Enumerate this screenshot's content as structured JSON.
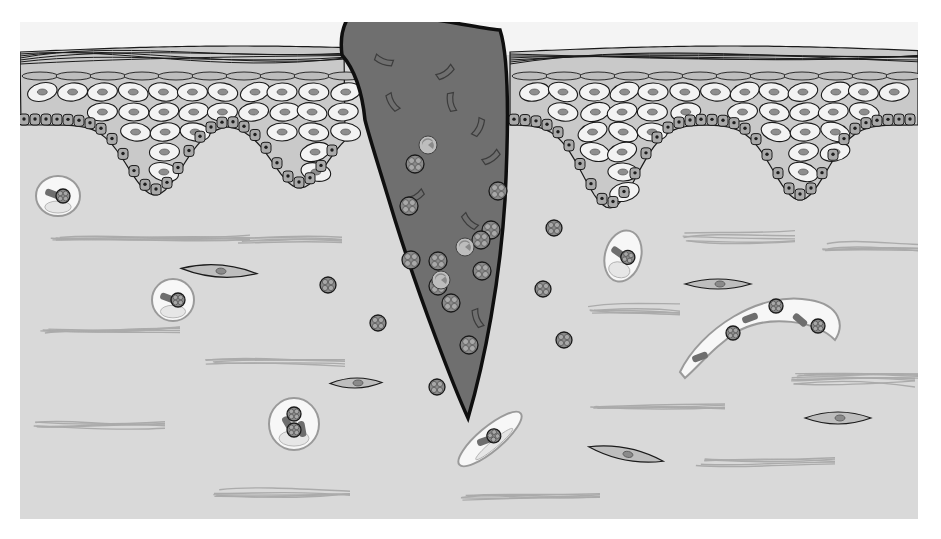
{
  "figure": {
    "width": 941,
    "height": 539,
    "panel": {
      "x": 20,
      "y": 22,
      "w": 898,
      "h": 497
    }
  },
  "colors": {
    "page_bg": "#ffffff",
    "top_bg": "#f4f4f4",
    "dermis": "#d9d9d9",
    "stratum_corneum": "#d6d6d6",
    "granular_layer": "#bdbdbd",
    "keratinocyte": "#f3f3f3",
    "keratinocyte_nucleus": "#8e8e8e",
    "intercellular": "#c9c9c9",
    "basal_cell": "#a9a9a9",
    "basal_nucleus": "#1e1e1e",
    "outline": "#1a1a1a",
    "wound": "#6f6f6f",
    "wound_outline": "#0f0f0f",
    "fibrin_fragment_stroke": "#3c3c3c",
    "neutrophil_fill": "#8a8a8a",
    "neutrophil_lobe": "#a8a8a8",
    "collagen": "#ababab",
    "fibroblast": "#bebebe",
    "fibroblast_nucleus": "#8a8a8a",
    "macrophage": "#f7f7f7",
    "macrophage_outline": "#9a9a9a",
    "macrophage_inclusion": "#6e6e6e"
  },
  "epidermis": {
    "left_segment": {
      "x0": 20,
      "x1": 345
    },
    "right_segment": {
      "x0": 510,
      "x1": 918
    },
    "rete_ridges": [
      {
        "cx": 155,
        "tip_y": 195
      },
      {
        "cx": 300,
        "tip_y": 188
      },
      {
        "cx": 610,
        "tip_y": 208
      },
      {
        "cx": 800,
        "tip_y": 200
      }
    ]
  },
  "wound": {
    "label": "ulcer-crater",
    "fibrin_fragments": [
      [
        384,
        60,
        20
      ],
      [
        445,
        72,
        -35
      ],
      [
        393,
        102,
        60
      ],
      [
        452,
        102,
        80
      ],
      [
        478,
        127,
        -65
      ],
      [
        491,
        157,
        -35
      ],
      [
        415,
        196,
        -30
      ],
      [
        470,
        221,
        45
      ],
      [
        478,
        318,
        70
      ]
    ],
    "neutrophils": [
      [
        415,
        164
      ],
      [
        498,
        191
      ],
      [
        409,
        206
      ],
      [
        491,
        230
      ],
      [
        411,
        260
      ],
      [
        481,
        240
      ],
      [
        438,
        261
      ],
      [
        482,
        271
      ],
      [
        451,
        303
      ],
      [
        469,
        345
      ],
      [
        438,
        286
      ]
    ],
    "degenerating_cells": [
      [
        428,
        145
      ],
      [
        465,
        247
      ],
      [
        441,
        280
      ]
    ]
  },
  "dermis": {
    "free_neutrophils": [
      [
        554,
        228
      ],
      [
        328,
        285
      ],
      [
        543,
        289
      ],
      [
        378,
        323
      ],
      [
        564,
        340
      ],
      [
        437,
        387
      ]
    ],
    "fibroblasts": [
      {
        "cx": 219,
        "cy": 271,
        "rx": 38,
        "ry": 6,
        "rot": 4
      },
      {
        "cx": 718,
        "cy": 284,
        "rx": 33,
        "ry": 5,
        "rot": 0
      },
      {
        "cx": 356,
        "cy": 383,
        "rx": 26,
        "ry": 5,
        "rot": -1
      },
      {
        "cx": 626,
        "cy": 454,
        "rx": 38,
        "ry": 6,
        "rot": 11
      },
      {
        "cx": 838,
        "cy": 418,
        "rx": 33,
        "ry": 6,
        "rot": 0
      }
    ],
    "collagen_bundles": [
      [
        50,
        240,
        200
      ],
      [
        232,
        240,
        110
      ],
      [
        820,
        247,
        100
      ],
      [
        680,
        237,
        115
      ],
      [
        40,
        333,
        140
      ],
      [
        205,
        363,
        140
      ],
      [
        585,
        310,
        95
      ],
      [
        30,
        423,
        135
      ],
      [
        795,
        376,
        140
      ],
      [
        590,
        410,
        135
      ],
      [
        695,
        462,
        140
      ],
      [
        210,
        493,
        140
      ],
      [
        460,
        497,
        140
      ],
      [
        785,
        381,
        130
      ]
    ],
    "macrophages": [
      {
        "cx": 58,
        "cy": 196,
        "rx": 22,
        "ry": 20,
        "rot": 0,
        "inclusions": 1
      },
      {
        "cx": 173,
        "cy": 300,
        "rx": 21,
        "ry": 21,
        "rot": 0,
        "inclusions": 1
      },
      {
        "cx": 623,
        "cy": 256,
        "rx": 18,
        "ry": 26,
        "rot": 15,
        "inclusions": 1
      },
      {
        "cx": 294,
        "cy": 424,
        "rx": 25,
        "ry": 26,
        "rot": 0,
        "inclusions": 2
      },
      {
        "cx": 490,
        "cy": 439,
        "rx": 40,
        "ry": 12,
        "rot": -40,
        "inclusions": 1
      }
    ],
    "elongated_macrophage": {
      "inclusions": 4
    }
  }
}
